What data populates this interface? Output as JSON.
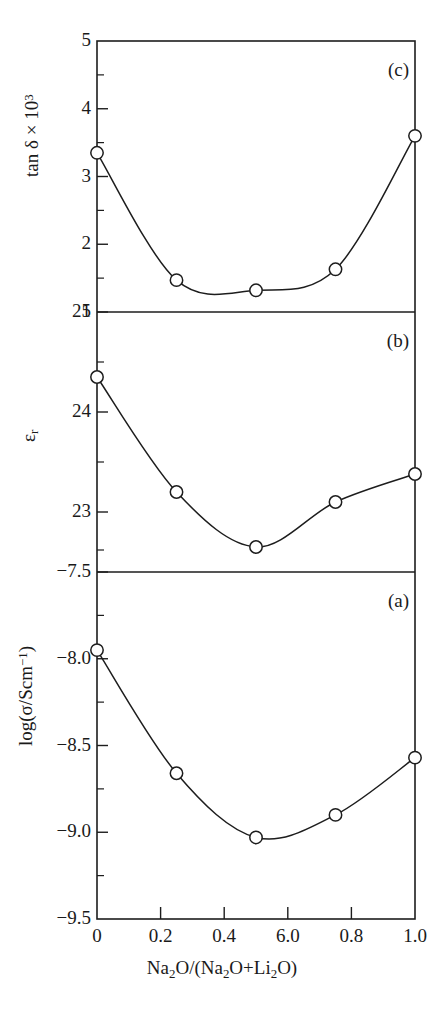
{
  "figure": {
    "xlabel_html": "Na<sub>2</sub>O/(Na<sub>2</sub>O+Li<sub>2</sub>O)",
    "xlabel_text": "Na2O/(Na2O+Li2O)",
    "x_tick_labels": [
      "0",
      "0.2",
      "0.4",
      "6.0",
      "0.8",
      "1.0"
    ],
    "x_tick_values": [
      0,
      0.2,
      0.4,
      0.6,
      0.8,
      1.0
    ],
    "panels": [
      {
        "tag": "(c)",
        "ylabel_html": "tan &#948; &#215; 10<sup>3</sup>",
        "ylabel_text": "tan delta x 10^3",
        "y_tick_labels": [
          "5",
          "4",
          "3",
          "2",
          "1"
        ],
        "y_tick_values": [
          5,
          4,
          3,
          2,
          1
        ]
      },
      {
        "tag": "(b)",
        "ylabel_html": "&#949;<sub>r</sub>",
        "ylabel_text": "epsilon_r",
        "y_tick_labels": [
          "25",
          "24",
          "23"
        ],
        "y_tick_values": [
          25,
          24,
          23
        ]
      },
      {
        "tag": "(a)",
        "ylabel_html": "log(&#963;/Scm<sup>&#8722;1</sup>)",
        "ylabel_text": "log(sigma/Scm^-1)",
        "y_tick_labels": [
          "−7.5",
          "−8.0",
          "−8.5",
          "−9.0",
          "−9.5"
        ],
        "y_tick_values": [
          -7.5,
          -8.0,
          -8.5,
          -9.0,
          -9.5
        ]
      }
    ],
    "colors": {
      "ink": "#1d1d1d",
      "background": "#ffffff",
      "marker_fill": "#ffffff"
    }
  },
  "chart_data": [
    {
      "type": "line",
      "panel": "c",
      "title": "(c)",
      "xlabel": "Na2O/(Na2O+Li2O)",
      "ylabel": "tan delta x 10^3",
      "x": [
        0,
        0.25,
        0.5,
        0.75,
        1.0
      ],
      "values": [
        3.35,
        1.47,
        1.32,
        1.63,
        3.6
      ],
      "xlim": [
        0,
        1.0
      ],
      "ylim": [
        1,
        5
      ],
      "yticks": [
        1,
        2,
        3,
        4,
        5
      ],
      "xticks": [
        0,
        0.2,
        0.4,
        0.6,
        0.8,
        1.0
      ],
      "grid": false,
      "legend": "none",
      "marker": "open-circle"
    },
    {
      "type": "line",
      "panel": "b",
      "title": "(b)",
      "xlabel": "Na2O/(Na2O+Li2O)",
      "ylabel": "epsilon_r",
      "x": [
        0,
        0.25,
        0.5,
        0.75,
        1.0
      ],
      "values": [
        24.35,
        23.2,
        22.65,
        23.1,
        23.38
      ],
      "xlim": [
        0,
        1.0
      ],
      "ylim": [
        22.4,
        25
      ],
      "yticks": [
        23,
        24,
        25
      ],
      "xticks": [
        0,
        0.2,
        0.4,
        0.6,
        0.8,
        1.0
      ],
      "grid": false,
      "legend": "none",
      "marker": "open-circle"
    },
    {
      "type": "line",
      "panel": "a",
      "title": "(a)",
      "xlabel": "Na2O/(Na2O+Li2O)",
      "ylabel": "log(sigma/Scm^-1)",
      "x": [
        0,
        0.25,
        0.5,
        0.75,
        1.0
      ],
      "values": [
        -7.95,
        -8.66,
        -9.03,
        -8.9,
        -8.57
      ],
      "xlim": [
        0,
        1.0
      ],
      "ylim": [
        -9.5,
        -7.5
      ],
      "yticks": [
        -9.5,
        -9.0,
        -8.5,
        -8.0,
        -7.5
      ],
      "xticks": [
        0,
        0.2,
        0.4,
        0.6,
        0.8,
        1.0
      ],
      "grid": false,
      "legend": "none",
      "marker": "open-circle"
    }
  ]
}
